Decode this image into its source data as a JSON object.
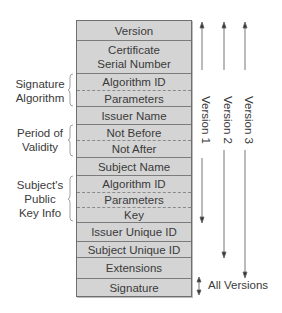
{
  "diagram": {
    "fields": [
      {
        "label": "Version",
        "height": 20,
        "sep": "solid"
      },
      {
        "label": "Certificate\nSerial Number",
        "line1": "Certificate",
        "line2": "Serial Number",
        "height": 33,
        "sep": "solid"
      },
      {
        "label": "Algorithm ID",
        "height": 17,
        "sep": "dashed"
      },
      {
        "label": "Parameters",
        "height": 16,
        "sep": "solid"
      },
      {
        "label": "Issuer Name",
        "height": 18,
        "sep": "solid"
      },
      {
        "label": "Not Before",
        "height": 16,
        "sep": "dashed"
      },
      {
        "label": "Not After",
        "height": 17,
        "sep": "solid"
      },
      {
        "label": "Subject Name",
        "height": 18,
        "sep": "solid"
      },
      {
        "label": "Algorithm ID",
        "height": 17,
        "sep": "dashed"
      },
      {
        "label": "Parameters",
        "height": 15,
        "sep": "dashed"
      },
      {
        "label": "Key",
        "height": 15,
        "sep": "solid"
      },
      {
        "label": "Issuer Unique ID",
        "height": 19,
        "sep": "solid"
      },
      {
        "label": "Subject Unique ID",
        "height": 16,
        "sep": "solid"
      },
      {
        "label": "Extensions",
        "height": 21,
        "sep": "solid"
      },
      {
        "label": "Signature",
        "height": 17,
        "sep": "none"
      }
    ],
    "groups": [
      {
        "label_line1": "Signature",
        "label_line2": "Algorithm",
        "label_line3": ""
      },
      {
        "label_line1": "Period of",
        "label_line2": "Validity",
        "label_line3": ""
      },
      {
        "label_line1": "Subject's",
        "label_line2": "Public",
        "label_line3": "Key Info"
      }
    ],
    "version_arrows": [
      {
        "label": "Version 1"
      },
      {
        "label": "Version 2"
      },
      {
        "label": "Version 3"
      }
    ],
    "all_versions_label": "All Versions",
    "colors": {
      "field_fill": "#d4d4d4",
      "border": "#6e6e6e",
      "text": "#3a3a3a",
      "arrow": "#555555"
    }
  }
}
